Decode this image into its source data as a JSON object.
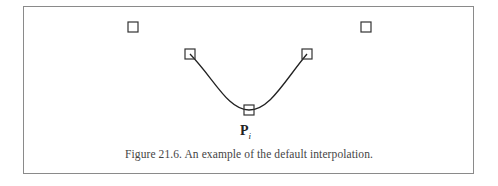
{
  "figure": {
    "label_main": "P",
    "label_sub": "i",
    "caption": "Figure 21.6.  An example of the default interpolation.",
    "control_points": [
      {
        "x": 133,
        "y": 27
      },
      {
        "x": 190,
        "y": 54
      },
      {
        "x": 249,
        "y": 110
      },
      {
        "x": 307,
        "y": 54
      },
      {
        "x": 366,
        "y": 27
      }
    ],
    "curve_color": "#222222",
    "square_color": "#333333"
  }
}
